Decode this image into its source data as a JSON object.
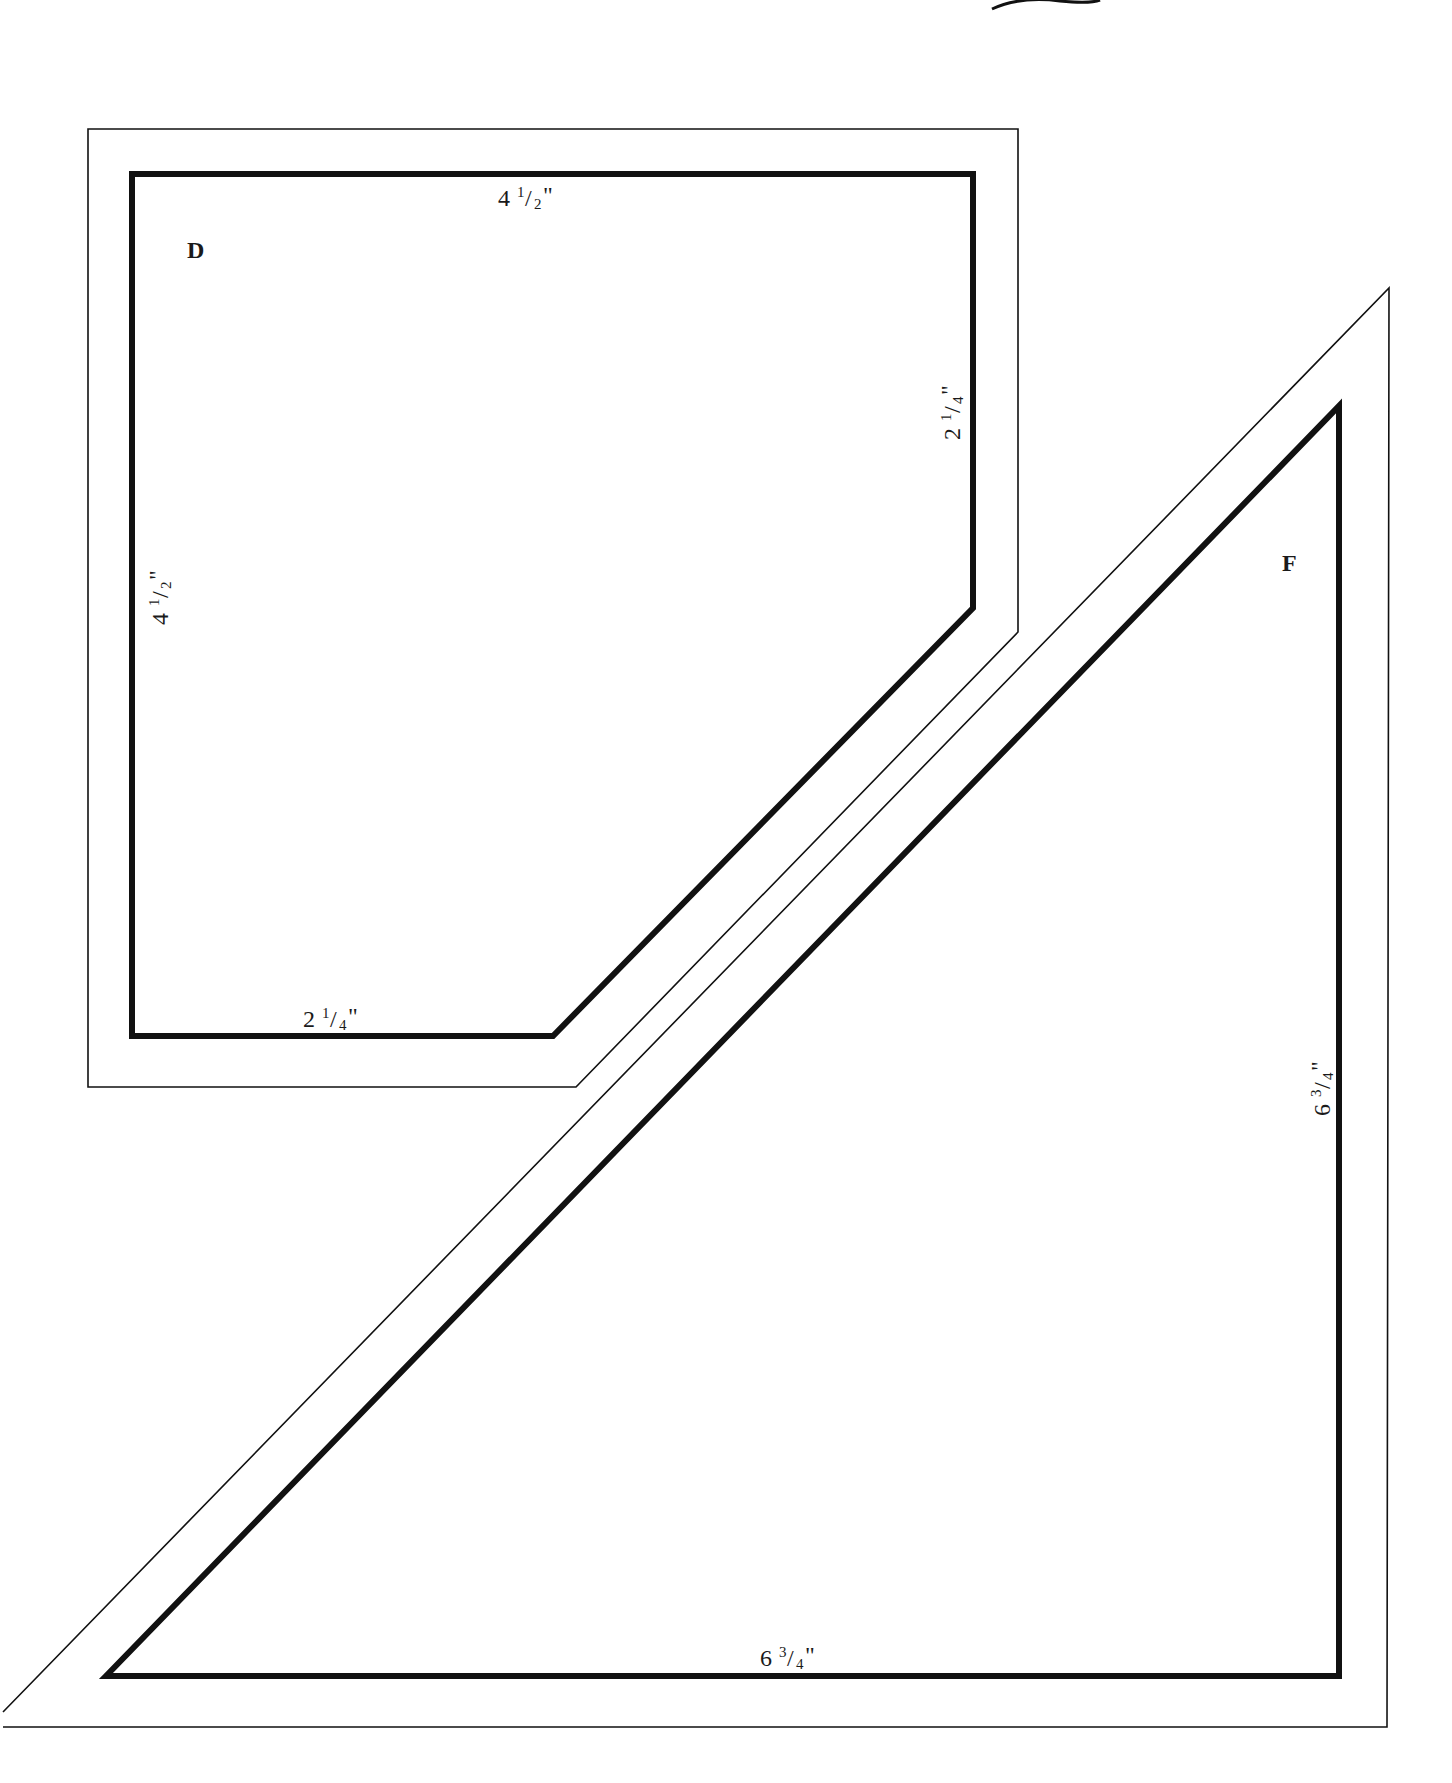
{
  "diagram": {
    "type": "quilt-template-pieces",
    "colors": {
      "stroke": "#111111",
      "background": "#ffffff"
    },
    "pieces": [
      {
        "id": "D",
        "label": "D",
        "shape": "pentagon (rectangle with clipped corner)",
        "seam_line": [
          [
            132,
            171
          ],
          [
            973,
            171
          ],
          [
            973,
            608
          ],
          [
            553,
            1039
          ],
          [
            132,
            1039
          ]
        ],
        "cut_line": [
          [
            88,
            129
          ],
          [
            1018,
            129
          ],
          [
            1018,
            632
          ],
          [
            576,
            1087
          ],
          [
            88,
            1087
          ]
        ],
        "dimensions": [
          {
            "side": "top",
            "whole": "4",
            "num": "1",
            "den": "2",
            "text": "4 1/2\""
          },
          {
            "side": "left",
            "whole": "4",
            "num": "1",
            "den": "2",
            "text": "4 1/2\""
          },
          {
            "side": "right",
            "whole": "2",
            "num": "1",
            "den": "4",
            "text": "2 1/4\""
          },
          {
            "side": "bottom",
            "whole": "2",
            "num": "1",
            "den": "4",
            "text": "2 1/4\""
          }
        ]
      },
      {
        "id": "F",
        "label": "F",
        "shape": "right triangle",
        "seam_line": [
          [
            1341,
            403
          ],
          [
            1341,
            1679
          ],
          [
            103,
            1679
          ]
        ],
        "cut_line": [
          [
            1389,
            288
          ],
          [
            1386,
            1727
          ],
          [
            3,
            1727
          ],
          [
            3,
            1712
          ]
        ],
        "dimensions": [
          {
            "side": "right",
            "whole": "6",
            "num": "3",
            "den": "4",
            "text": "6 3/4\""
          },
          {
            "side": "bottom",
            "whole": "6",
            "num": "3",
            "den": "4",
            "text": "6 3/4\""
          }
        ]
      }
    ]
  }
}
